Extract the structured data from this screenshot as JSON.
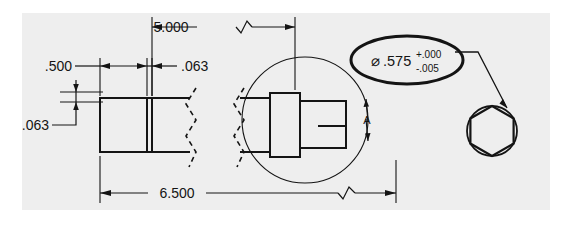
{
  "drawing": {
    "title": "Mechanical part detail drawing",
    "sheet_background_color": "#ffffff",
    "drawing_area_color": "#eeeeee",
    "line_color": "#141414",
    "dimensions": [
      {
        "id": "overall_top",
        "label": "5.000",
        "orientation": "horizontal",
        "has_break_symbol": true
      },
      {
        "id": "left_width",
        "label": ".500",
        "orientation": "horizontal",
        "has_break_symbol": false
      },
      {
        "id": "groove_width",
        "label": ".063",
        "orientation": "horizontal",
        "has_break_symbol": false
      },
      {
        "id": "groove_depth",
        "label": ".063",
        "orientation": "vertical",
        "has_break_symbol": false
      },
      {
        "id": "overall_bottom",
        "label": "6.500",
        "orientation": "horizontal",
        "has_break_symbol": true
      }
    ],
    "callout": {
      "diameter_symbol": "⌀",
      "value": ".575",
      "tolerance_upper": "+.000",
      "tolerance_lower": "-.005"
    },
    "view_marker": {
      "letter": "A"
    },
    "detail_views": [
      {
        "id": "detail-circle",
        "shape": "circle",
        "description": "detail enclosure circle around stepped shaft"
      },
      {
        "id": "hex-end-view",
        "shape": "hexagon-in-circle",
        "description": "hex end view of shaft"
      }
    ]
  }
}
